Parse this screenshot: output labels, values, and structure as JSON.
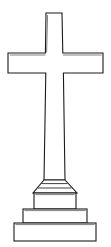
{
  "image": {
    "subject": "cross-monument",
    "description": "Line drawing of a Latin cross memorial monument on a three-tier stepped pedestal",
    "style": "black outline line art on white background",
    "width": 111,
    "height": 247,
    "background_color": "#ffffff",
    "line_color": "#1a1a1a",
    "fill_color": "#ffffff"
  },
  "parts": {
    "cross": {
      "name": "latin-cross",
      "vertical_shaft": {
        "top_y": 13,
        "top_left_x": 46,
        "top_right_x": 62,
        "bottom_y": 180,
        "bottom_left_x": 44,
        "bottom_right_x": 65
      },
      "horizontal_arm": {
        "top_y": 53,
        "bottom_y": 73,
        "left_x": 8,
        "right_x": 103
      }
    },
    "capital": {
      "name": "flared-capital",
      "top_y": 180,
      "bottom_y": 193,
      "top_left_x": 44,
      "top_right_x": 65,
      "bottom_left_x": 33,
      "bottom_right_x": 77
    },
    "pedestal_tiers": [
      {
        "name": "upper-block",
        "top_y": 193,
        "bottom_y": 209,
        "left_x": 34,
        "right_x": 76
      },
      {
        "name": "middle-step",
        "top_y": 209,
        "bottom_y": 223,
        "left_x": 23,
        "right_x": 87
      },
      {
        "name": "bottom-base",
        "top_y": 223,
        "bottom_y": 241,
        "left_x": 14,
        "right_x": 96
      }
    ]
  },
  "colors": {
    "stroke": "#1a1a1a",
    "stroke_soft": "#2b2b2b",
    "stroke_hair": "#4a4a4a",
    "fill": "#ffffff",
    "background": "#ffffff"
  },
  "labels": {
    "figure_title": "",
    "caption": ""
  }
}
